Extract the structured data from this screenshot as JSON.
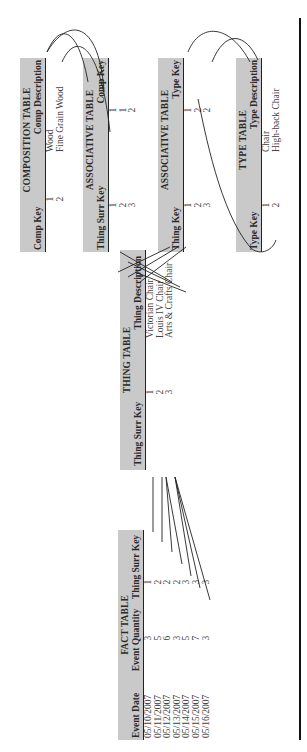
{
  "fact_table": {
    "title": "FACT TABLE",
    "columns": [
      "Event Date",
      "Event Quantity",
      "Thing Surr Key"
    ],
    "rows": [
      [
        "05/10/2007",
        "3",
        "1"
      ],
      [
        "05/11/2007",
        "5",
        "2"
      ],
      [
        "05/12/2007",
        "6",
        "2"
      ],
      [
        "05/13/2007",
        "3",
        "2"
      ],
      [
        "05/14/2007",
        "5",
        "3"
      ],
      [
        "05/15/2007",
        "7",
        "3"
      ],
      [
        "05/16/2007",
        "3",
        "3"
      ]
    ]
  },
  "thing_table": {
    "title": "THING TABLE",
    "columns": [
      "Thing Surr Key",
      "Thing Description"
    ],
    "rows": [
      [
        "1",
        "Victorian Chair"
      ],
      [
        "2",
        "Louis IV Chair"
      ],
      [
        "3",
        "Arts & Crafts Chair"
      ]
    ]
  },
  "composition_table": {
    "title": "COMPOSITION TABLE",
    "columns": [
      "Comp Key",
      "Comp Description"
    ],
    "rows": [
      [
        "1",
        "Wood"
      ],
      [
        "2",
        "Fine Grain Wood"
      ]
    ]
  },
  "assoc_comp_table": {
    "title": "ASSOCIATIVE TABLE",
    "columns": [
      "Thing Surr Key",
      "Comp Key"
    ],
    "rows": [
      [
        "1",
        "1"
      ],
      [
        "2",
        "1"
      ],
      [
        "3",
        "2"
      ]
    ]
  },
  "assoc_type_table": {
    "title": "ASSOCIATIVE TABLE",
    "columns": [
      "Thing Key",
      "Type Key"
    ],
    "rows": [
      [
        "1",
        "1"
      ],
      [
        "2",
        "2"
      ],
      [
        "3",
        "2"
      ]
    ]
  },
  "type_table": {
    "title": "TYPE TABLE",
    "columns": [
      "Type Key",
      "Type Description"
    ],
    "rows": [
      [
        "1",
        "Chair"
      ],
      [
        "2",
        "High-back Chair"
      ]
    ]
  },
  "colors": {
    "header_fill": "#c9c9c9",
    "line": "#222222",
    "text": "#333333"
  }
}
